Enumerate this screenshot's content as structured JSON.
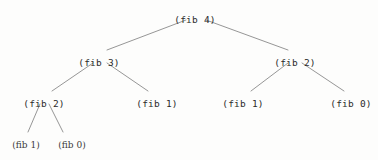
{
  "figure": {
    "kind": "recursion-tree",
    "background_color": "#fdfdfc",
    "edge_color": "#8a8a8a",
    "text_color": "#2b2b2b"
  },
  "chart_data": {
    "type": "diagram",
    "title": "",
    "nodes": [
      {
        "id": "n0",
        "label": "(fib 4)",
        "level": 0,
        "x": 195,
        "y": 14,
        "style": "mono"
      },
      {
        "id": "n1",
        "label": "(fib 3)",
        "level": 1,
        "x": 99,
        "y": 57,
        "style": "mono"
      },
      {
        "id": "n2",
        "label": "(fib 2)",
        "level": 1,
        "x": 295,
        "y": 57,
        "style": "mono"
      },
      {
        "id": "n3",
        "label": "(fib 2)",
        "level": 2,
        "x": 44,
        "y": 98,
        "style": "mono"
      },
      {
        "id": "n4",
        "label": "(fib 1)",
        "level": 2,
        "x": 157,
        "y": 98,
        "style": "mono"
      },
      {
        "id": "n5",
        "label": "(fib 1)",
        "level": 2,
        "x": 243,
        "y": 98,
        "style": "mono"
      },
      {
        "id": "n6",
        "label": "(fib 0)",
        "level": 2,
        "x": 351,
        "y": 98,
        "style": "mono"
      },
      {
        "id": "n7",
        "label": "(fib 1)",
        "level": 3,
        "x": 26,
        "y": 140,
        "style": "serif"
      },
      {
        "id": "n8",
        "label": "(fib 0)",
        "level": 3,
        "x": 72,
        "y": 140,
        "style": "serif"
      }
    ],
    "edges": [
      {
        "from": "n0",
        "to": "n1",
        "x1": 186,
        "y1": 20,
        "x2": 107,
        "y2": 50
      },
      {
        "from": "n0",
        "to": "n2",
        "x1": 206,
        "y1": 20,
        "x2": 288,
        "y2": 50
      },
      {
        "from": "n1",
        "to": "n3",
        "x1": 93,
        "y1": 63,
        "x2": 52,
        "y2": 91
      },
      {
        "from": "n1",
        "to": "n4",
        "x1": 107,
        "y1": 63,
        "x2": 148,
        "y2": 91
      },
      {
        "from": "n2",
        "to": "n5",
        "x1": 288,
        "y1": 63,
        "x2": 251,
        "y2": 91
      },
      {
        "from": "n2",
        "to": "n6",
        "x1": 302,
        "y1": 63,
        "x2": 344,
        "y2": 91
      },
      {
        "from": "n3",
        "to": "n7",
        "x1": 40,
        "y1": 104,
        "x2": 28,
        "y2": 132
      },
      {
        "from": "n3",
        "to": "n8",
        "x1": 49,
        "y1": 104,
        "x2": 63,
        "y2": 132
      }
    ]
  }
}
